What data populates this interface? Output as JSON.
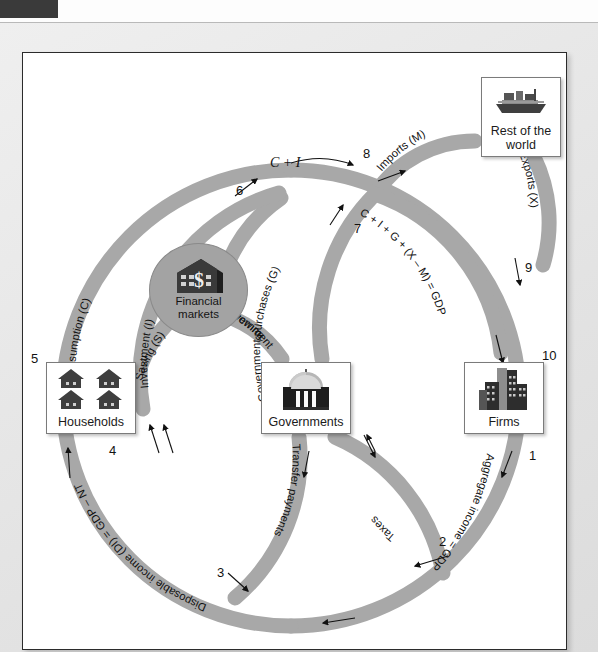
{
  "window": {
    "tab_label": ""
  },
  "diagram": {
    "entities": [
      {
        "id": "rest-of-world",
        "label_line1": "Rest of the",
        "label_line2": "world",
        "icon": "cargo-ship-icon"
      },
      {
        "id": "households",
        "label_line1": "Households",
        "label_line2": "",
        "icon": "houses-icon"
      },
      {
        "id": "governments",
        "label_line1": "Governments",
        "label_line2": "",
        "icon": "capitol-building-icon"
      },
      {
        "id": "firms",
        "label_line1": "Firms",
        "label_line2": "",
        "icon": "office-buildings-icon"
      },
      {
        "id": "financial-markets",
        "label_line1": "Financial",
        "label_line2": "markets",
        "icon": "bank-dollar-icon"
      }
    ],
    "flows": [
      {
        "n": "1",
        "label": "Aggregate income = GDP",
        "from": "firms",
        "to": "households"
      },
      {
        "n": "2",
        "label": "Aggregate income = GDP",
        "from": "firms",
        "to": "households"
      },
      {
        "n": "3",
        "label": "Transfer payments",
        "from": "governments",
        "to": "households"
      },
      {
        "n": "4",
        "label": "Disposable income (DI) = GDP – NT",
        "from": "junction",
        "to": "households"
      },
      {
        "n": "5",
        "label": "Consumption (C)",
        "from": "households",
        "to": "firms"
      },
      {
        "n": "6",
        "label": "C + I",
        "from": "junction",
        "to": "firms"
      },
      {
        "n": "7",
        "label": "Government purchases (G)",
        "from": "governments",
        "to": "firms"
      },
      {
        "n": "8",
        "label": "Imports (M)",
        "from": "junction",
        "to": "rest-of-world"
      },
      {
        "n": "9",
        "label": "C + I + G + (X – M) = GDP",
        "from": "junction",
        "to": "firms"
      },
      {
        "n": "10",
        "label": "Exports (X)",
        "from": "rest-of-world",
        "to": "firms"
      }
    ],
    "flow_labels": {
      "consumption": "Consumption (C)",
      "saving": "Saving (S)",
      "investment": "Investment (I)",
      "c_plus_i": "C + I",
      "gov_purchases": "Government purchases (G)",
      "gov_borrowing": "Government borrowing",
      "imports": "Imports (M)",
      "exports": "Exports (X)",
      "gdp_expenditure": "C + I + G + (X – M) = GDP",
      "aggregate_income": "Aggregate income = GDP",
      "taxes": "Taxes",
      "transfer_payments": "Transfer payments",
      "disposable_income": "Disposable income (DI) = GDP – NT"
    },
    "numbers": [
      "1",
      "2",
      "3",
      "4",
      "5",
      "6",
      "7",
      "8",
      "9",
      "10"
    ],
    "colors": {
      "pipe": "#a8a8a8",
      "pipe_stroke": "#9a9a9a",
      "panel_bg": "#ffffff",
      "panel_border": "#2b2b2b",
      "page_bg": "#e4e4e4",
      "text": "#111111",
      "financial_fill": "#a3a3a3"
    }
  }
}
